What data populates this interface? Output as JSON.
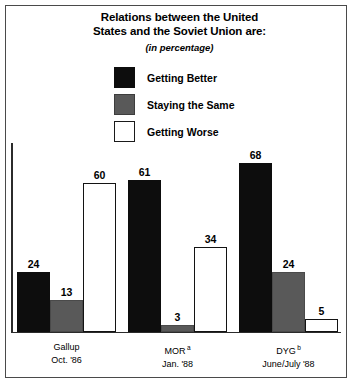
{
  "chart_data": {
    "type": "bar",
    "title": "Relations between the United States and the Soviet Union are:",
    "title_line1": "Relations between the United",
    "title_line2": "States and the Soviet Union are:",
    "subtitle": "(in percentage)",
    "xlabel": "",
    "ylabel": "",
    "ylim": [
      0,
      72
    ],
    "grid": false,
    "legend_position": "top-center",
    "categories": [
      "Gallup Oct. '86",
      "MOR Jan. '88",
      "DYG June/July '88"
    ],
    "category_labels": [
      {
        "line1": "Gallup",
        "line2": "Oct. '86",
        "footnote": ""
      },
      {
        "line1": "MOR",
        "line2": "Jan. '88",
        "footnote": "a"
      },
      {
        "line1": "DYG",
        "line2": "June/July '88",
        "footnote": "b"
      }
    ],
    "series": [
      {
        "name": "Getting Better",
        "color": "#0d0d0d",
        "values": [
          24,
          61,
          68
        ]
      },
      {
        "name": "Staying the Same",
        "color": "#595959",
        "values": [
          13,
          3,
          24
        ]
      },
      {
        "name": "Getting Worse",
        "color": "#ffffff",
        "values": [
          60,
          34,
          5
        ]
      }
    ],
    "legend": [
      {
        "label": "Getting Better",
        "swatch": "black"
      },
      {
        "label": "Staying the Same",
        "swatch": "gray"
      },
      {
        "label": "Getting Worse",
        "swatch": "white"
      }
    ],
    "bars": [
      {
        "group": 0,
        "series": 0,
        "value": "24",
        "x": 17,
        "w": 33,
        "h": 60
      },
      {
        "group": 0,
        "series": 1,
        "value": "13",
        "x": 50,
        "w": 33,
        "h": 32
      },
      {
        "group": 0,
        "series": 2,
        "value": "60",
        "x": 83,
        "w": 33,
        "h": 149
      },
      {
        "group": 1,
        "series": 0,
        "value": "61",
        "x": 128,
        "w": 33,
        "h": 152
      },
      {
        "group": 1,
        "series": 1,
        "value": "3",
        "x": 161,
        "w": 33,
        "h": 7
      },
      {
        "group": 1,
        "series": 2,
        "value": "34",
        "x": 194,
        "w": 33,
        "h": 85
      },
      {
        "group": 2,
        "series": 0,
        "value": "68",
        "x": 239,
        "w": 33,
        "h": 169
      },
      {
        "group": 2,
        "series": 1,
        "value": "24",
        "x": 272,
        "w": 33,
        "h": 60
      },
      {
        "group": 2,
        "series": 2,
        "value": "5",
        "x": 305,
        "w": 33,
        "h": 13
      }
    ]
  },
  "colors": {
    "black": "#0d0d0d",
    "gray": "#595959",
    "white": "#ffffff",
    "frame": "#4a4a4a",
    "axis": "#2b2b2b"
  }
}
